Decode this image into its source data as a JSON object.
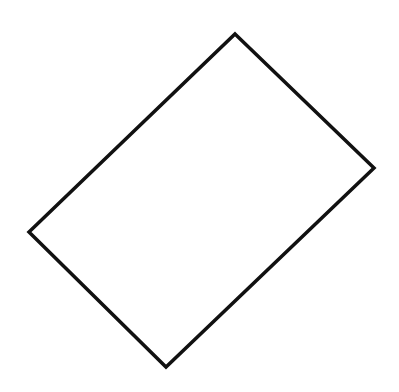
{
  "diagram": {
    "background": "#ffffff",
    "shapes": [
      {
        "type": "rectangle-rotated",
        "stroke": "#111111",
        "stroke_width": 3.5,
        "fill": "none",
        "vertices": [
          {
            "x": 235,
            "y": 34
          },
          {
            "x": 374,
            "y": 168
          },
          {
            "x": 166,
            "y": 367
          },
          {
            "x": 29,
            "y": 232
          }
        ],
        "points": "235,34 374,168 166,367 29,232"
      }
    ]
  }
}
